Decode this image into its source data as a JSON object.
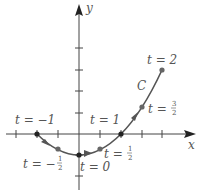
{
  "diagram": {
    "axes": {
      "x_label": "x",
      "y_label": "y",
      "origin_px": [
        79,
        134
      ],
      "unit_px": 21,
      "x_ticks": [
        -3,
        -2,
        -1,
        1,
        2,
        3,
        4
      ],
      "y_ticks": [
        -2,
        -1,
        1,
        2,
        3,
        4
      ]
    },
    "curve": {
      "name": "C",
      "color": "#555555",
      "parametric": "x = 2t, y = t^2 - 1",
      "t_range": [
        -1,
        2
      ]
    },
    "points": [
      {
        "t": "-1",
        "x": -2,
        "y": 0,
        "label": "t = −1"
      },
      {
        "t": "-1/2",
        "x": -1,
        "y": -0.75,
        "label_prefix": "t = −",
        "num": "1",
        "den": "2"
      },
      {
        "t": "0",
        "x": 0,
        "y": -1,
        "label": "t = 0"
      },
      {
        "t": "1/2",
        "x": 1,
        "y": -0.75,
        "label_prefix": "t = ",
        "num": "1",
        "den": "2"
      },
      {
        "t": "1",
        "x": 2,
        "y": 0,
        "label": "t = 1"
      },
      {
        "t": "3/2",
        "x": 3,
        "y": 1.25,
        "label_prefix": "t = ",
        "num": "3",
        "den": "2"
      },
      {
        "t": "2",
        "x": 4,
        "y": 3,
        "label": "t = 2"
      }
    ]
  }
}
